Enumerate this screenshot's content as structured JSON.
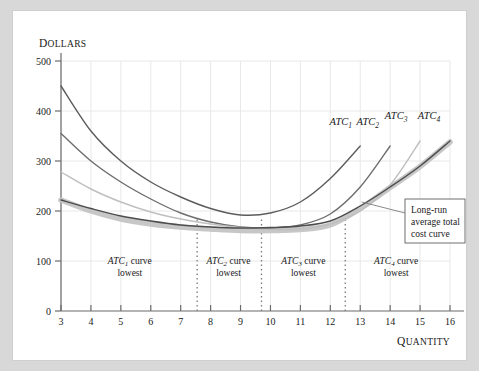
{
  "chart_data": {
    "type": "line",
    "title": "",
    "xlabel": "Quantity",
    "ylabel": "Dollars",
    "xlim": [
      3,
      16
    ],
    "ylim": [
      0,
      500
    ],
    "grid": true,
    "xticks": [
      3,
      4,
      5,
      6,
      7,
      8,
      9,
      10,
      11,
      12,
      13,
      14,
      15,
      16
    ],
    "yticks": [
      0,
      100,
      200,
      300,
      400,
      500
    ],
    "legend_position": "above-curve-ends",
    "series": [
      {
        "name": "ATC1",
        "label": "ATC",
        "subscript": "1",
        "color": "#5c5c5c",
        "x": [
          3,
          4,
          5,
          6,
          7,
          8,
          9,
          10,
          11,
          12,
          13
        ],
        "y": [
          450,
          360,
          300,
          258,
          228,
          205,
          192,
          196,
          218,
          265,
          330
        ]
      },
      {
        "name": "ATC2",
        "label": "ATC",
        "subscript": "2",
        "color": "#6e6e6e",
        "x": [
          3,
          4,
          5,
          6,
          7,
          8,
          9,
          10,
          11,
          12,
          13,
          14
        ],
        "y": [
          355,
          300,
          258,
          224,
          196,
          178,
          168,
          166,
          172,
          194,
          248,
          330
        ]
      },
      {
        "name": "ATC3",
        "label": "ATC",
        "subscript": "3",
        "color": "#bfbfbf",
        "x": [
          3,
          4,
          5,
          6,
          7,
          8,
          9,
          10,
          11,
          12,
          13,
          14,
          15
        ],
        "y": [
          278,
          244,
          218,
          198,
          184,
          174,
          167,
          163,
          164,
          174,
          200,
          252,
          340
        ]
      },
      {
        "name": "ATC4",
        "label": "ATC",
        "subscript": "4",
        "color": "#4d4d4d",
        "x": [
          3,
          4,
          5,
          6,
          7,
          8,
          9,
          10,
          11,
          12,
          13,
          14,
          15,
          16
        ],
        "y": [
          222,
          205,
          190,
          180,
          172,
          168,
          166,
          167,
          170,
          180,
          210,
          248,
          290,
          340
        ]
      },
      {
        "name": "long-run-average-total-cost",
        "label": "Long-run average total cost curve",
        "color": "#c4c4c4",
        "envelope": true,
        "x": [
          3,
          4,
          5,
          6,
          7,
          8,
          9,
          10,
          11,
          12,
          13,
          14,
          15,
          16
        ],
        "y": [
          222,
          200,
          184,
          174,
          168,
          164,
          161,
          161,
          163,
          172,
          205,
          247,
          289,
          338
        ]
      }
    ],
    "dividers": [
      {
        "name": "divider-atc1-atc2",
        "x": 7.55
      },
      {
        "name": "divider-atc2-atc3",
        "x": 9.7
      },
      {
        "name": "divider-atc3-atc4",
        "x": 12.5
      }
    ],
    "regions": [
      {
        "name": "region-atc1",
        "label_prefix": "ATC",
        "subscript": "1",
        "label_suffix": " curve",
        "line2": "lowest",
        "center_x": 5.3
      },
      {
        "name": "region-atc2",
        "label_prefix": "ATC",
        "subscript": "2",
        "label_suffix": " curve",
        "line2": "lowest",
        "center_x": 8.6
      },
      {
        "name": "region-atc3",
        "label_prefix": "ATC",
        "subscript": "3",
        "label_suffix": " curve",
        "line2": "lowest",
        "center_x": 11.1
      },
      {
        "name": "region-atc4",
        "label_prefix": "ATC",
        "subscript": "4",
        "label_suffix": " curve",
        "line2": "lowest",
        "center_x": 14.2
      }
    ],
    "annotation": {
      "name": "long-run-callout",
      "lines": [
        "Long-run",
        "average total",
        "cost curve"
      ],
      "pointer_from_x": 13.05,
      "pointer_from_y": 218
    }
  },
  "axes": {
    "y_title_first": "D",
    "y_title_rest": "OLLARS",
    "x_title_first": "Q",
    "x_title_rest": "UANTITY"
  },
  "colors": {
    "background": "#d8d8d8",
    "card": "#ffffff",
    "frame": "#cfcfcf",
    "grid": "#e8e8e8",
    "axis": "#6b6b6b",
    "text": "#1a1a1a",
    "lrac": "#c4c4c4",
    "divider": "#7a7a7a"
  }
}
